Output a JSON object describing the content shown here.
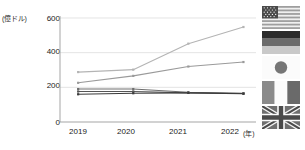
{
  "chart_data": {
    "type": "line",
    "title": "",
    "xlabel": "(年)",
    "ylabel": "(億ドル)",
    "x": [
      "2019",
      "2020",
      "2021",
      "2022"
    ],
    "categories": [
      "2019",
      "2020",
      "2021",
      "2022"
    ],
    "ylim": [
      0,
      600
    ],
    "yticks": [
      0,
      200,
      400,
      600
    ],
    "grid": true,
    "legend_position": "right",
    "legend_type": "flag-icons",
    "series": [
      {
        "name": "アメリカ",
        "legend_icon": "flag-usa",
        "color": "#b4b4b4",
        "values": [
          288,
          302,
          452,
          548
        ]
      },
      {
        "name": "ドイツ",
        "legend_icon": "flag-germany",
        "color": "#9a9a9a",
        "values": [
          226,
          266,
          320,
          346
        ]
      },
      {
        "name": "日本",
        "legend_icon": "flag-japan",
        "color": "#6e6e6e",
        "values": [
          190,
          190,
          172,
          166
        ]
      },
      {
        "name": "フランス",
        "legend_icon": "flag-france",
        "color": "#555555",
        "values": [
          176,
          176,
          168,
          164
        ]
      },
      {
        "name": "イギリス",
        "legend_icon": "flag-uk",
        "color": "#3a3a3a",
        "values": [
          160,
          166,
          168,
          163
        ]
      }
    ]
  },
  "axis": {
    "y_unit": "(億ドル)",
    "x_unit": "(年)",
    "yticks": [
      "600",
      "400",
      "200",
      "0"
    ],
    "xticks": [
      "2019",
      "2020",
      "2021",
      "2022"
    ]
  },
  "legend": {
    "items": [
      {
        "icon": "flag-usa-icon",
        "label": "アメリカ"
      },
      {
        "icon": "flag-germany-icon",
        "label": "ドイツ"
      },
      {
        "icon": "flag-japan-icon",
        "label": "日本"
      },
      {
        "icon": "flag-france-icon",
        "label": "フランス"
      },
      {
        "icon": "flag-uk-icon",
        "label": "イギリス"
      }
    ]
  },
  "colors": {
    "grid": "#d8d8d8",
    "axis": "#9b9b9b",
    "text": "#1a1a1a",
    "background": "#ffffff"
  }
}
